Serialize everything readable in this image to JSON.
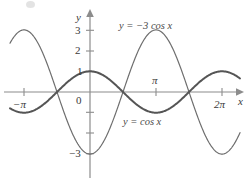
{
  "chart_data": {
    "type": "line",
    "title": "",
    "xlabel": "x",
    "ylabel": "y",
    "xlim": [
      -4.5,
      7.4
    ],
    "ylim": [
      -3.9,
      3.9
    ],
    "grid": false,
    "legend": "inline-annotations",
    "x_ticks": [
      {
        "value": -3.14159,
        "label": "−π"
      },
      {
        "value": 3.14159,
        "label": "π"
      },
      {
        "value": 6.28319,
        "label": "2π"
      }
    ],
    "y_ticks": [
      {
        "value": 3,
        "label": "3"
      },
      {
        "value": 2,
        "label": "2"
      },
      {
        "value": 1,
        "label": "1"
      },
      {
        "value": -1,
        "label": ""
      },
      {
        "value": -2,
        "label": ""
      },
      {
        "value": -3,
        "label": "−3"
      }
    ],
    "origin_label": "0",
    "series": [
      {
        "name": "y = −3 cos x",
        "expression": "-3*cos(x)",
        "amplitude": -3,
        "period": 6.28319,
        "color": "#6e6e6e",
        "stroke_width": 1.2,
        "annotation": "y = −3 cos x",
        "key_points": [
          {
            "x": -3.14159,
            "y": 3
          },
          {
            "x": -1.5708,
            "y": 0
          },
          {
            "x": 0,
            "y": -3
          },
          {
            "x": 1.5708,
            "y": 0
          },
          {
            "x": 3.14159,
            "y": 3
          },
          {
            "x": 4.71239,
            "y": 0
          },
          {
            "x": 6.28319,
            "y": -3
          }
        ]
      },
      {
        "name": "y = cos x",
        "expression": "cos(x)",
        "amplitude": 1,
        "period": 6.28319,
        "color": "#555555",
        "stroke_width": 2.0,
        "annotation": "y = cos x",
        "key_points": [
          {
            "x": -3.14159,
            "y": -1
          },
          {
            "x": -1.5708,
            "y": 0
          },
          {
            "x": 0,
            "y": 1
          },
          {
            "x": 1.5708,
            "y": 0
          },
          {
            "x": 3.14159,
            "y": -1
          },
          {
            "x": 4.71239,
            "y": 0
          },
          {
            "x": 6.28319,
            "y": 1
          }
        ]
      }
    ],
    "annotations": [
      {
        "text": "y = −3 cos x",
        "x": 2.0,
        "y": 3.6,
        "series": "y = −3 cos x"
      },
      {
        "text": "y = cos x",
        "x": 2.1,
        "y": -1.45,
        "series": "y = cos x"
      }
    ],
    "axis_color": "#8c8c8c",
    "text_color": "#3a3a3a"
  },
  "labels": {
    "y_axis_name": "y",
    "x_axis_name": "x",
    "origin": "0",
    "tick_3": "3",
    "tick_2": "2",
    "tick_1": "1",
    "tick_neg3": "−3",
    "tick_neg_pi": "−π",
    "tick_pi": "π",
    "tick_2pi": "2π",
    "curve_a": "y = −3 cos x",
    "curve_b": "y = cos x"
  }
}
